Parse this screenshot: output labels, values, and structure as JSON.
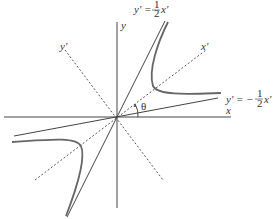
{
  "diagram": {
    "colors": {
      "axis": "#444444",
      "rotated_axis": "#555555",
      "asymptote": "#444444",
      "hyperbola": "#666666",
      "text": "#333333"
    },
    "labels": {
      "x_axis": "x",
      "y_axis": "y",
      "x_prime_axis": "x'",
      "y_prime_axis": "y'",
      "angle": "θ"
    },
    "equations": {
      "upper_asymptote": {
        "lhs": "y' = ",
        "num": "1",
        "den": "2",
        "rhs": "x'"
      },
      "lower_asymptote": {
        "lhs": "y' = −",
        "num": "1",
        "den": "2",
        "rhs": "x'"
      }
    }
  }
}
